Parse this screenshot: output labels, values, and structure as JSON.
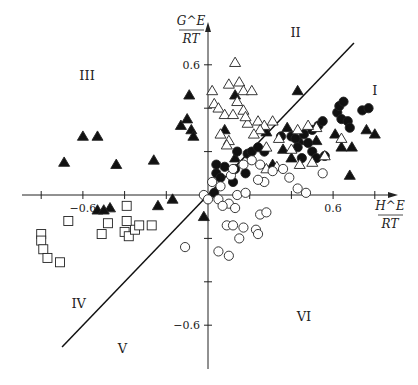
{
  "chart_data": {
    "type": "scatter",
    "title": "",
    "xlabel": {
      "num": "H^E",
      "den": "RT"
    },
    "ylabel": {
      "num": "G^E",
      "den": "RT"
    },
    "x_ticks": [
      -0.8,
      -0.6,
      -0.4,
      -0.2,
      0.2,
      0.4,
      0.6,
      0.8
    ],
    "x_tick_labels": [
      {
        "value": -0.6,
        "text": "−0.6"
      },
      {
        "value": 0.6,
        "text": "0.6"
      }
    ],
    "y_ticks": [
      0.6,
      0.4,
      0.2,
      -0.2,
      -0.4,
      -0.6
    ],
    "y_tick_labels": [
      {
        "value": 0.6,
        "text": "0.6"
      },
      {
        "value": -0.6,
        "text": "−0.6"
      }
    ],
    "xlim": [
      -0.9,
      0.9
    ],
    "ylim": [
      -0.8,
      0.9
    ],
    "grid": false,
    "diagonal_line": {
      "x": [
        -0.7,
        0.7
      ],
      "y": [
        -0.7,
        0.7
      ]
    },
    "region_labels": [
      {
        "text": "I",
        "x": 0.8,
        "y": 0.46
      },
      {
        "text": "II",
        "x": 0.42,
        "y": 0.73
      },
      {
        "text": "III",
        "x": -0.58,
        "y": 0.53
      },
      {
        "text": "IV",
        "x": -0.62,
        "y": -0.52
      },
      {
        "text": "V",
        "x": -0.41,
        "y": -0.73
      },
      {
        "text": "VI",
        "x": 0.46,
        "y": -0.58
      }
    ],
    "series": [
      {
        "name": "filled triangles",
        "marker": "triangle-filled",
        "points": [
          [
            -0.69,
            0.15
          ],
          [
            -0.6,
            0.27
          ],
          [
            -0.53,
            0.27
          ],
          [
            -0.44,
            0.14
          ],
          [
            -0.26,
            0.16
          ],
          [
            -0.47,
            -0.06
          ],
          [
            -0.53,
            -0.07
          ],
          [
            -0.5,
            -0.07
          ],
          [
            -0.24,
            -0.05
          ],
          [
            -0.17,
            -0.02
          ],
          [
            -0.13,
            0.32
          ],
          [
            -0.1,
            0.35
          ],
          [
            -0.08,
            0.3
          ],
          [
            -0.07,
            0.27
          ],
          [
            -0.09,
            0.46
          ],
          [
            -0.02,
            -0.1
          ],
          [
            0.13,
            0.46
          ],
          [
            0.08,
            0.3
          ],
          [
            0.13,
            0.17
          ],
          [
            0.28,
            0.29
          ],
          [
            0.43,
            0.48
          ],
          [
            0.36,
            0.21
          ],
          [
            0.4,
            0.17
          ],
          [
            0.38,
            0.31
          ],
          [
            0.44,
            0.25
          ],
          [
            0.61,
            0.28
          ],
          [
            0.64,
            0.22
          ],
          [
            0.69,
            0.22
          ],
          [
            0.76,
            0.3
          ],
          [
            0.8,
            0.28
          ],
          [
            0.68,
            0.09
          ],
          [
            0.31,
            0.14
          ],
          [
            0.52,
            0.25
          ]
        ]
      },
      {
        "name": "filled circles",
        "marker": "circle-filled",
        "points": [
          [
            0.04,
            0.1
          ],
          [
            0.08,
            0.13
          ],
          [
            0.04,
            0.14
          ],
          [
            0.13,
            0.12
          ],
          [
            0.14,
            0.2
          ],
          [
            0.19,
            0.19
          ],
          [
            0.21,
            0.2
          ],
          [
            0.18,
            0.1
          ],
          [
            0.12,
            0.06
          ],
          [
            0.03,
            0.01
          ],
          [
            0.35,
            0.27
          ],
          [
            0.4,
            0.27
          ],
          [
            0.42,
            0.26
          ],
          [
            0.46,
            0.28
          ],
          [
            0.48,
            0.24
          ],
          [
            0.5,
            0.3
          ],
          [
            0.53,
            0.32
          ],
          [
            0.55,
            0.34
          ],
          [
            0.5,
            0.2
          ],
          [
            0.52,
            0.17
          ],
          [
            0.56,
            0.18
          ],
          [
            0.62,
            0.38
          ],
          [
            0.63,
            0.41
          ],
          [
            0.65,
            0.43
          ],
          [
            0.64,
            0.35
          ],
          [
            0.67,
            0.34
          ],
          [
            0.68,
            0.31
          ],
          [
            0.74,
            0.39
          ],
          [
            0.77,
            0.4
          ],
          [
            0.45,
            0.17
          ],
          [
            0.43,
            0.22
          ],
          [
            0.27,
            0.2
          ],
          [
            0.24,
            0.22
          ],
          [
            0.06,
            0.08
          ]
        ]
      },
      {
        "name": "open triangles",
        "marker": "triangle-open",
        "points": [
          [
            0.13,
            0.61
          ],
          [
            0.15,
            0.52
          ],
          [
            0.17,
            0.48
          ],
          [
            0.21,
            0.48
          ],
          [
            0.1,
            0.51
          ],
          [
            0.02,
            0.48
          ],
          [
            0.03,
            0.42
          ],
          [
            0.05,
            0.4
          ],
          [
            0.14,
            0.43
          ],
          [
            0.17,
            0.39
          ],
          [
            0.08,
            0.37
          ],
          [
            0.12,
            0.37
          ],
          [
            0.19,
            0.33
          ],
          [
            0.18,
            0.36
          ],
          [
            0.24,
            0.34
          ],
          [
            0.27,
            0.32
          ],
          [
            0.31,
            0.34
          ],
          [
            0.25,
            0.3
          ],
          [
            0.22,
            0.28
          ],
          [
            0.06,
            0.28
          ],
          [
            0.1,
            0.25
          ],
          [
            0.09,
            0.23
          ],
          [
            0.28,
            0.22
          ],
          [
            0.34,
            0.26
          ],
          [
            0.4,
            0.21
          ],
          [
            0.44,
            0.14
          ],
          [
            0.5,
            0.15
          ],
          [
            0.56,
            0.18
          ],
          [
            0.64,
            0.26
          ],
          [
            0.43,
            0.3
          ],
          [
            0.52,
            0.31
          ],
          [
            0.48,
            0.32
          ],
          [
            0.33,
            0.13
          ],
          [
            0.28,
            0.12
          ]
        ]
      },
      {
        "name": "open circles",
        "marker": "circle-open",
        "points": [
          [
            -0.02,
            -0.0
          ],
          [
            0.0,
            -0.02
          ],
          [
            0.02,
            0.06
          ],
          [
            0.06,
            0.04
          ],
          [
            0.05,
            -0.02
          ],
          [
            0.1,
            -0.04
          ],
          [
            0.07,
            -0.05
          ],
          [
            0.14,
            0.0
          ],
          [
            0.11,
            0.09
          ],
          [
            0.12,
            0.12
          ],
          [
            0.21,
            0.16
          ],
          [
            0.17,
            0.14
          ],
          [
            0.25,
            0.14
          ],
          [
            0.27,
            0.06
          ],
          [
            0.24,
            0.07
          ],
          [
            0.31,
            0.11
          ],
          [
            0.36,
            0.12
          ],
          [
            0.39,
            0.08
          ],
          [
            0.43,
            0.03
          ],
          [
            0.47,
            0.01
          ],
          [
            0.55,
            0.1
          ],
          [
            0.18,
            0.01
          ],
          [
            0.25,
            -0.09
          ],
          [
            0.28,
            -0.08
          ],
          [
            0.13,
            -0.06
          ],
          [
            0.09,
            -0.14
          ],
          [
            0.17,
            -0.15
          ],
          [
            0.23,
            -0.16
          ],
          [
            0.15,
            -0.2
          ],
          [
            0.12,
            -0.14
          ],
          [
            -0.11,
            -0.24
          ],
          [
            0.05,
            -0.26
          ],
          [
            0.1,
            -0.28
          ],
          [
            0.24,
            -0.18
          ]
        ]
      },
      {
        "name": "open squares",
        "marker": "square-open",
        "points": [
          [
            -0.8,
            -0.18
          ],
          [
            -0.8,
            -0.21
          ],
          [
            -0.79,
            -0.25
          ],
          [
            -0.77,
            -0.29
          ],
          [
            -0.51,
            -0.18
          ],
          [
            -0.67,
            -0.12
          ],
          [
            -0.48,
            -0.13
          ],
          [
            -0.4,
            -0.17
          ],
          [
            -0.38,
            -0.19
          ],
          [
            -0.35,
            -0.16
          ],
          [
            -0.39,
            -0.12
          ],
          [
            -0.39,
            -0.05
          ],
          [
            -0.33,
            -0.14
          ],
          [
            -0.27,
            -0.14
          ],
          [
            -0.71,
            -0.31
          ]
        ]
      }
    ]
  }
}
